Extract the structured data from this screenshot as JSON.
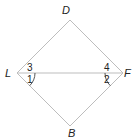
{
  "diagram": {
    "type": "quadrilateral-with-diagonal",
    "vertices": {
      "D": {
        "label": "D",
        "x": 70,
        "y": 20
      },
      "L": {
        "label": "L",
        "x": 17,
        "y": 73
      },
      "F": {
        "label": "F",
        "x": 123,
        "y": 73
      },
      "B": {
        "label": "B",
        "x": 70,
        "y": 126
      }
    },
    "edges": [
      [
        "L",
        "D"
      ],
      [
        "D",
        "F"
      ],
      [
        "F",
        "B"
      ],
      [
        "B",
        "L"
      ],
      [
        "L",
        "F"
      ]
    ],
    "angles": {
      "a1": {
        "label": "1",
        "at": "L",
        "position": "below diagonal",
        "marked": true
      },
      "a2": {
        "label": "2",
        "at": "F",
        "position": "below diagonal",
        "marked": true
      },
      "a3": {
        "label": "3",
        "at": "L",
        "position": "above diagonal",
        "marked": false
      },
      "a4": {
        "label": "4",
        "at": "F",
        "position": "above diagonal",
        "marked": false
      }
    },
    "colors": {
      "edge": "#bdbdbd",
      "text": "#222222",
      "arc": "#444444"
    }
  }
}
